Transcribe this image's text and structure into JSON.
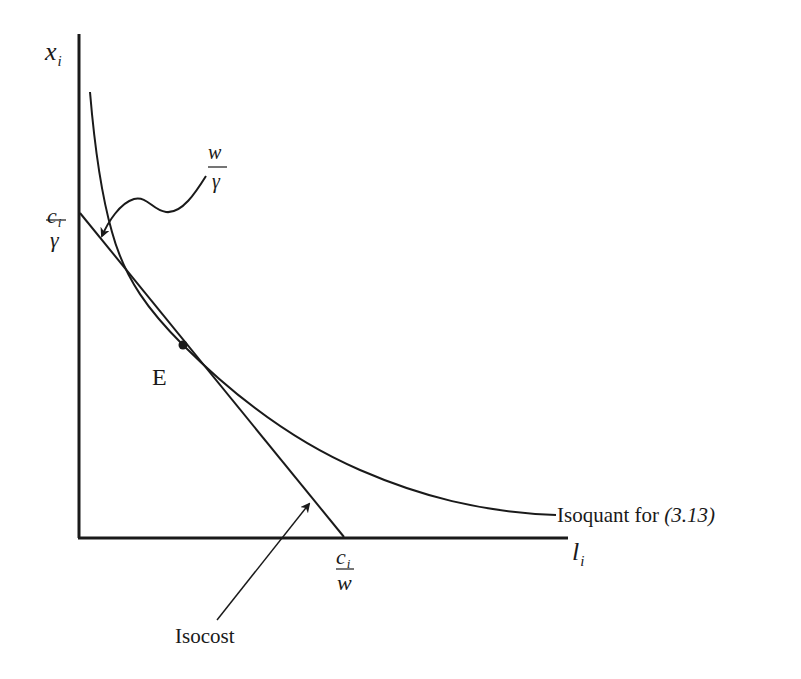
{
  "diagram": {
    "type": "isoquant-isocost",
    "axes": {
      "y_label": "x",
      "y_label_sub": "i",
      "x_label": "l",
      "x_label_sub": "i"
    },
    "intercepts": {
      "y_intercept": {
        "numerator": "c",
        "numerator_sub": "i",
        "denominator": "γ"
      },
      "x_intercept": {
        "numerator": "c",
        "numerator_sub": "i",
        "denominator": "w"
      }
    },
    "slope_label": {
      "numerator": "w",
      "denominator": "γ"
    },
    "point": {
      "label": "E"
    },
    "curves": {
      "isoquant_label": "Isoquant for ",
      "isoquant_ref": "(3.13)",
      "isocost_label": "Isocost"
    },
    "colors": {
      "ink": "#1a1a1a",
      "background": "#ffffff"
    }
  }
}
